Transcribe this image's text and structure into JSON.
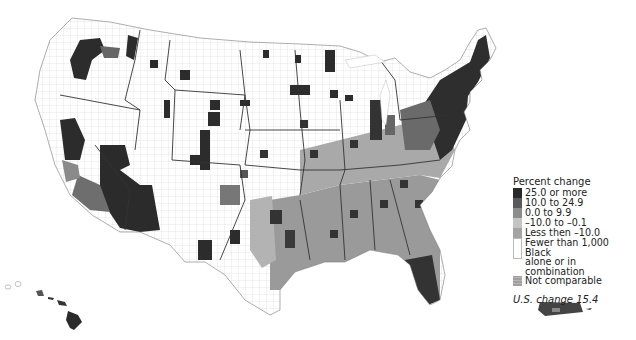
{
  "map": {
    "type": "choropleth",
    "subject": "Percent change by county",
    "regions_shown": [
      "Contiguous United States",
      "Hawaii",
      "Puerto Rico"
    ]
  },
  "legend": {
    "title": "Percent change",
    "items": [
      {
        "label": "25.0 or more",
        "color": "#2a2a2a"
      },
      {
        "label": "10.0 to 24.9",
        "color": "#5a5a5a"
      },
      {
        "label": "0.0 to 9.9",
        "color": "#8c8c8c"
      },
      {
        "label": "–10.0 to –0.1",
        "color": "#b8b8b8"
      },
      {
        "label": "Less then –10.0",
        "color": "#a4a4a4"
      },
      {
        "label": "Fewer than 1,000 Black alone or in combination",
        "line1": "Fewer than 1,000 Black",
        "line2": "alone or in combination",
        "color": "#ffffff"
      },
      {
        "label": "Not comparable",
        "color": "#a0a0a0"
      }
    ],
    "us_change": "U.S. change 15.4"
  },
  "colors": {
    "background": "#ffffff",
    "border": "#333333",
    "county_line": "#c8c8c8"
  }
}
